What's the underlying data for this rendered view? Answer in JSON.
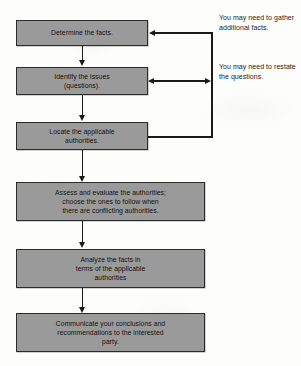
{
  "diagram": {
    "colors": {
      "node_fill": "#9a9a9a",
      "node_border": "#2a2a2a",
      "connector": "#1a1a1a",
      "text": "#111111",
      "background": "#fdfdfc"
    },
    "nodes": [
      {
        "id": "determine-facts",
        "lines": [
          "Determine the facts."
        ]
      },
      {
        "id": "identify-issues",
        "lines": [
          "Identify the issues",
          "(questions)."
        ]
      },
      {
        "id": "locate-authorities",
        "lines": [
          "Locate the applicable",
          "authorities."
        ]
      },
      {
        "id": "assess-authorities",
        "lines": [
          "Assess and evaluate the authorities;",
          "choose the ones to follow when",
          "there are conflicting authorities."
        ]
      },
      {
        "id": "analyze-facts",
        "lines": [
          "Analyze the facts in",
          "terms of the applicable",
          "authorities"
        ]
      },
      {
        "id": "communicate-conclusions",
        "lines": [
          "Communicate your conclusions and",
          "recommendations to the interested",
          "party."
        ]
      }
    ],
    "annotations": [
      {
        "id": "gather-facts-note",
        "lines": [
          "You may need to",
          "gather additional",
          "facts."
        ]
      },
      {
        "id": "restate-questions-note",
        "lines": [
          "You may need to",
          "restate the",
          "questions."
        ]
      }
    ]
  }
}
